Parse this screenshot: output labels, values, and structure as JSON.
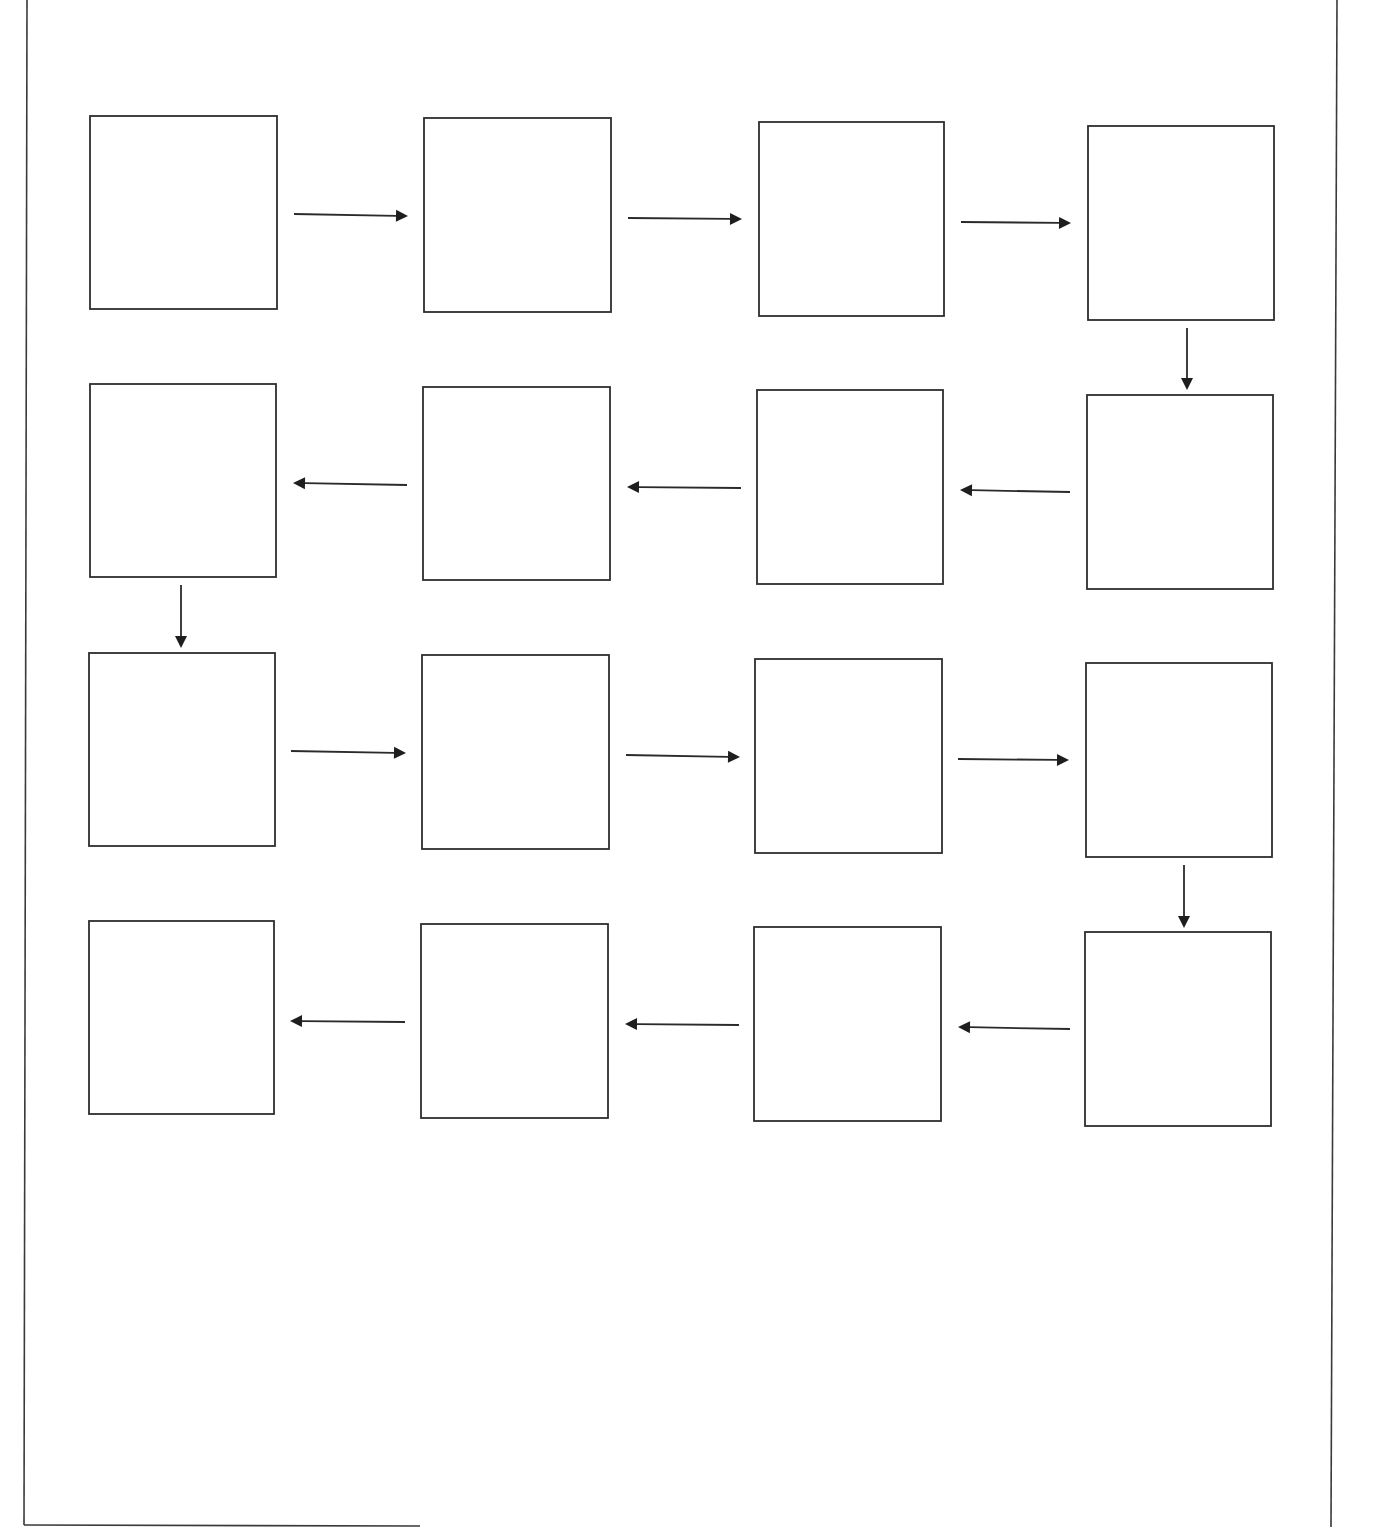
{
  "diagram": {
    "type": "serpentine-sequence-flowchart",
    "colors": {
      "stroke": "#2e2e2e",
      "background": "#ffffff"
    },
    "page_border": {
      "left_top": [
        27,
        0
      ],
      "left_bottom": [
        24,
        1525
      ],
      "right_top": [
        1337,
        0
      ],
      "right_bottom": [
        1331,
        1527
      ],
      "bottom_visible_to_x": 420
    },
    "boxes": [
      {
        "id": 1,
        "row": 1,
        "col": 1,
        "x": 90,
        "y": 116,
        "w": 187,
        "h": 193,
        "label": ""
      },
      {
        "id": 2,
        "row": 1,
        "col": 2,
        "x": 424,
        "y": 118,
        "w": 187,
        "h": 194,
        "label": ""
      },
      {
        "id": 3,
        "row": 1,
        "col": 3,
        "x": 759,
        "y": 122,
        "w": 185,
        "h": 194,
        "label": ""
      },
      {
        "id": 4,
        "row": 1,
        "col": 4,
        "x": 1088,
        "y": 126,
        "w": 186,
        "h": 194,
        "label": ""
      },
      {
        "id": 5,
        "row": 2,
        "col": 4,
        "x": 1087,
        "y": 395,
        "w": 186,
        "h": 194,
        "label": ""
      },
      {
        "id": 6,
        "row": 2,
        "col": 3,
        "x": 757,
        "y": 390,
        "w": 186,
        "h": 194,
        "label": ""
      },
      {
        "id": 7,
        "row": 2,
        "col": 2,
        "x": 423,
        "y": 387,
        "w": 187,
        "h": 193,
        "label": ""
      },
      {
        "id": 8,
        "row": 2,
        "col": 1,
        "x": 90,
        "y": 384,
        "w": 186,
        "h": 193,
        "label": ""
      },
      {
        "id": 9,
        "row": 3,
        "col": 1,
        "x": 89,
        "y": 653,
        "w": 186,
        "h": 193,
        "label": ""
      },
      {
        "id": 10,
        "row": 3,
        "col": 2,
        "x": 422,
        "y": 655,
        "w": 187,
        "h": 194,
        "label": ""
      },
      {
        "id": 11,
        "row": 3,
        "col": 3,
        "x": 755,
        "y": 659,
        "w": 187,
        "h": 194,
        "label": ""
      },
      {
        "id": 12,
        "row": 3,
        "col": 4,
        "x": 1086,
        "y": 663,
        "w": 186,
        "h": 194,
        "label": ""
      },
      {
        "id": 13,
        "row": 4,
        "col": 4,
        "x": 1085,
        "y": 932,
        "w": 186,
        "h": 194,
        "label": ""
      },
      {
        "id": 14,
        "row": 4,
        "col": 3,
        "x": 754,
        "y": 927,
        "w": 187,
        "h": 194,
        "label": ""
      },
      {
        "id": 15,
        "row": 4,
        "col": 2,
        "x": 421,
        "y": 924,
        "w": 187,
        "h": 194,
        "label": ""
      },
      {
        "id": 16,
        "row": 4,
        "col": 1,
        "x": 89,
        "y": 921,
        "w": 185,
        "h": 193,
        "label": ""
      }
    ],
    "arrows": [
      {
        "from": 1,
        "to": 2,
        "dir": "right",
        "x1": 294,
        "y1": 214,
        "x2": 408,
        "y2": 216
      },
      {
        "from": 2,
        "to": 3,
        "dir": "right",
        "x1": 628,
        "y1": 218,
        "x2": 742,
        "y2": 219
      },
      {
        "from": 3,
        "to": 4,
        "dir": "right",
        "x1": 961,
        "y1": 222,
        "x2": 1071,
        "y2": 223
      },
      {
        "from": 4,
        "to": 5,
        "dir": "down",
        "x1": 1187,
        "y1": 328,
        "x2": 1187,
        "y2": 390
      },
      {
        "from": 5,
        "to": 6,
        "dir": "left",
        "x1": 1070,
        "y1": 492,
        "x2": 960,
        "y2": 490
      },
      {
        "from": 6,
        "to": 7,
        "dir": "left",
        "x1": 741,
        "y1": 488,
        "x2": 627,
        "y2": 487
      },
      {
        "from": 7,
        "to": 8,
        "dir": "left",
        "x1": 407,
        "y1": 485,
        "x2": 293,
        "y2": 483
      },
      {
        "from": 8,
        "to": 9,
        "dir": "down",
        "x1": 181,
        "y1": 585,
        "x2": 181,
        "y2": 648
      },
      {
        "from": 9,
        "to": 10,
        "dir": "right",
        "x1": 291,
        "y1": 751,
        "x2": 406,
        "y2": 753
      },
      {
        "from": 10,
        "to": 11,
        "dir": "right",
        "x1": 626,
        "y1": 755,
        "x2": 740,
        "y2": 757
      },
      {
        "from": 11,
        "to": 12,
        "dir": "right",
        "x1": 958,
        "y1": 759,
        "x2": 1069,
        "y2": 760
      },
      {
        "from": 12,
        "to": 13,
        "dir": "down",
        "x1": 1184,
        "y1": 865,
        "x2": 1184,
        "y2": 928
      },
      {
        "from": 13,
        "to": 14,
        "dir": "left",
        "x1": 1070,
        "y1": 1029,
        "x2": 958,
        "y2": 1027
      },
      {
        "from": 14,
        "to": 15,
        "dir": "left",
        "x1": 739,
        "y1": 1025,
        "x2": 625,
        "y2": 1024
      },
      {
        "from": 15,
        "to": 16,
        "dir": "left",
        "x1": 405,
        "y1": 1022,
        "x2": 290,
        "y2": 1021
      }
    ]
  }
}
